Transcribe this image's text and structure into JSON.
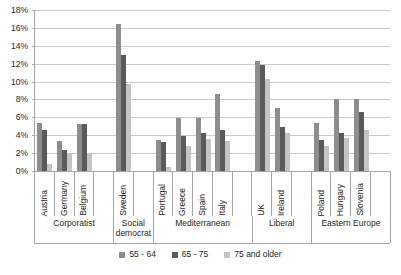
{
  "chart_data": {
    "type": "bar",
    "title": "",
    "subtitle": "",
    "xlabel": "",
    "ylabel": "",
    "ylim": [
      0,
      18
    ],
    "ytick_labels": [
      "0%",
      "2%",
      "4%",
      "6%",
      "8%",
      "10%",
      "12%",
      "14%",
      "16%",
      "18%"
    ],
    "ytick_values": [
      0,
      2,
      4,
      6,
      8,
      10,
      12,
      14,
      16,
      18
    ],
    "grid": true,
    "legend_position": "bottom",
    "value_unit": "%",
    "categories": [
      "Austria",
      "Germany",
      "Belgium",
      "Sweden",
      "Portugal",
      "Greece",
      "Spain",
      "Italy",
      "UK",
      "Ireland",
      "Poland",
      "Hungary",
      "Slovenia"
    ],
    "groups": [
      {
        "label": "Corporatist",
        "categories": [
          "Austria",
          "Germany",
          "Belgium"
        ],
        "trailing_empty_slots": 1
      },
      {
        "label": "Social democrat",
        "categories": [
          "Sweden"
        ],
        "trailing_empty_slots": 1
      },
      {
        "label": "Mediterranean",
        "categories": [
          "Portugal",
          "Greece",
          "Spain",
          "Italy"
        ],
        "trailing_empty_slots": 1
      },
      {
        "label": "Liberal",
        "categories": [
          "UK",
          "Ireland"
        ],
        "trailing_empty_slots": 1
      },
      {
        "label": "Eastern Europe",
        "categories": [
          "Poland",
          "Hungary",
          "Slovenia"
        ],
        "trailing_empty_slots": 1
      }
    ],
    "series": [
      {
        "name": "55 - 64",
        "color": "#8d8d8d",
        "values": [
          5.4,
          3.4,
          5.3,
          16.4,
          3.5,
          5.9,
          5.9,
          8.6,
          12.3,
          7.0,
          5.4,
          8.0,
          8.0
        ]
      },
      {
        "name": "65 - 75",
        "color": "#5a5a5a",
        "values": [
          4.6,
          2.4,
          5.3,
          13.0,
          3.2,
          3.9,
          4.2,
          4.6,
          11.9,
          4.9,
          3.5,
          4.3,
          6.6
        ]
      },
      {
        "name": "75 and older",
        "color": "#c4c4c4",
        "values": [
          0.8,
          2.0,
          2.0,
          9.7,
          0.5,
          2.8,
          3.6,
          3.3,
          10.3,
          4.2,
          2.8,
          3.7,
          4.6
        ]
      }
    ]
  },
  "legend": {
    "entries": [
      {
        "label": "55 - 64",
        "color": "#8d8d8d"
      },
      {
        "label": "65 - 75",
        "color": "#5a5a5a"
      },
      {
        "label": "75 and older",
        "color": "#c4c4c4"
      }
    ]
  },
  "colors": {
    "series_55_64": "#8d8d8d",
    "series_65_75": "#5a5a5a",
    "series_75_older": "#c4c4c4",
    "gridline": "#c9c9c9",
    "axis": "#a6a6a6",
    "text": "#231f20",
    "background": "#ffffff"
  }
}
